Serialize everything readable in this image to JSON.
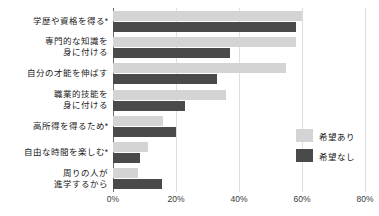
{
  "chart_data": {
    "type": "bar",
    "orientation": "horizontal",
    "title": "",
    "subtitle": "",
    "xlabel": "",
    "ylabel": "",
    "xlim": [
      0,
      80
    ],
    "xticks": [
      "0%",
      "20%",
      "40%",
      "60%",
      "80%"
    ],
    "xtick_values": [
      0,
      20,
      40,
      60,
      80
    ],
    "grid": true,
    "legend_position": "right",
    "categories": [
      "学歴や資格を得る*",
      "専門的な知識を\n身に付ける",
      "自分の才能を伸ばす",
      "職業的技能を\n身に付ける",
      "高所得を得るため*",
      "自由な時間を楽しむ*",
      "周りの人が\n進学するから"
    ],
    "category_lines": [
      [
        "学歴や資格を得る*"
      ],
      [
        "専門的な知識を",
        "身に付ける"
      ],
      [
        "自分の才能を伸ばす"
      ],
      [
        "職業的技能を",
        "身に付ける"
      ],
      [
        "高所得を得るため*"
      ],
      [
        "自由な時間を楽しむ*"
      ],
      [
        "周りの人が",
        "進学するから"
      ]
    ],
    "series": [
      {
        "name": "希望あり",
        "color": "#d4d4d4",
        "values": [
          60.0,
          58.0,
          55.0,
          36.0,
          16.0,
          11.0,
          8.0
        ]
      },
      {
        "name": "希望なし",
        "color": "#4a4a4a",
        "values": [
          58.0,
          37.0,
          33.0,
          23.0,
          20.0,
          8.5,
          15.5
        ]
      }
    ]
  },
  "legend": {
    "items": [
      {
        "label": "希望あり",
        "color": "#d4d4d4"
      },
      {
        "label": "希望なし",
        "color": "#4a4a4a"
      }
    ]
  },
  "axis": {
    "tick_labels": [
      "0%",
      "20%",
      "40%",
      "60%",
      "80%"
    ]
  },
  "colors": {
    "series_light": "#d4d4d4",
    "series_dark": "#4a4a4a",
    "grid": "#dedede",
    "axis": "#6e6e6e",
    "text": "#1a1a1a",
    "background": "#ffffff"
  }
}
